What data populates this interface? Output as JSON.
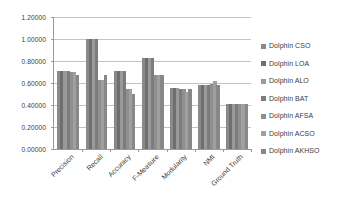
{
  "chart_data": {
    "type": "bar",
    "title": "",
    "subtitle": "",
    "xlabel": "",
    "ylabel": "",
    "ylim": [
      0,
      1.2
    ],
    "yticks": [
      0,
      0.2,
      0.4,
      0.6,
      0.8,
      1.0,
      1.2
    ],
    "ytick_labels": [
      "0.00000",
      "0.20000",
      "0.40000",
      "0.60000",
      "0.80000",
      "1.00000",
      "1.20000"
    ],
    "grid": "horizontal",
    "legend_position": "right",
    "categories": [
      "Precision",
      "Recall",
      "Accuracy",
      "F-Measure",
      "Modularity",
      "NMI",
      "Ground Truth"
    ],
    "series": [
      {
        "name": "Dolphin CSO",
        "color": "#8a8a8a",
        "values": [
          0.71,
          1.0,
          0.71,
          0.83,
          0.555,
          0.585,
          0.41
        ]
      },
      {
        "name": "Dolphin LOA",
        "color": "#6f6f6f",
        "values": [
          0.71,
          1.0,
          0.71,
          0.83,
          0.555,
          0.585,
          0.41
        ]
      },
      {
        "name": "Dolphin ALO",
        "color": "#9a9a9a",
        "values": [
          0.71,
          1.0,
          0.71,
          0.83,
          0.555,
          0.585,
          0.41
        ]
      },
      {
        "name": "Dolphin BAT",
        "color": "#7c7c7c",
        "values": [
          0.71,
          1.0,
          0.71,
          0.83,
          0.55,
          0.585,
          0.41
        ]
      },
      {
        "name": "Dolphin AFSA",
        "color": "#8f8f8f",
        "values": [
          0.7,
          0.63,
          0.55,
          0.67,
          0.55,
          0.59,
          0.41
        ]
      },
      {
        "name": "Dolphin ACSO",
        "color": "#9f9f9f",
        "values": [
          0.7,
          0.63,
          0.55,
          0.67,
          0.52,
          0.62,
          0.41
        ]
      },
      {
        "name": "Dolphin AKHSO",
        "color": "#888888",
        "values": [
          0.67,
          0.67,
          0.5,
          0.67,
          0.55,
          0.58,
          0.41
        ]
      }
    ]
  },
  "legend": {
    "items": [
      {
        "label": "Dolphin CSO",
        "color": "#8a8a8a"
      },
      {
        "label": "Dolphin LOA",
        "color": "#6f6f6f"
      },
      {
        "label": "Dolphin ALO",
        "color": "#9a9a9a"
      },
      {
        "label": "Dolphin BAT",
        "color": "#7c7c7c"
      },
      {
        "label": "Dolphin AFSA",
        "color": "#8f8f8f"
      },
      {
        "label": "Dolphin ACSO",
        "color": "#9f9f9f"
      },
      {
        "label": "Dolphin AKHSO",
        "color": "#888888"
      }
    ]
  },
  "colors": {
    "axis": "#9a9a9a",
    "gridline": "#c3c3c3",
    "text": "#3d3d3d",
    "background": "#ffffff"
  }
}
